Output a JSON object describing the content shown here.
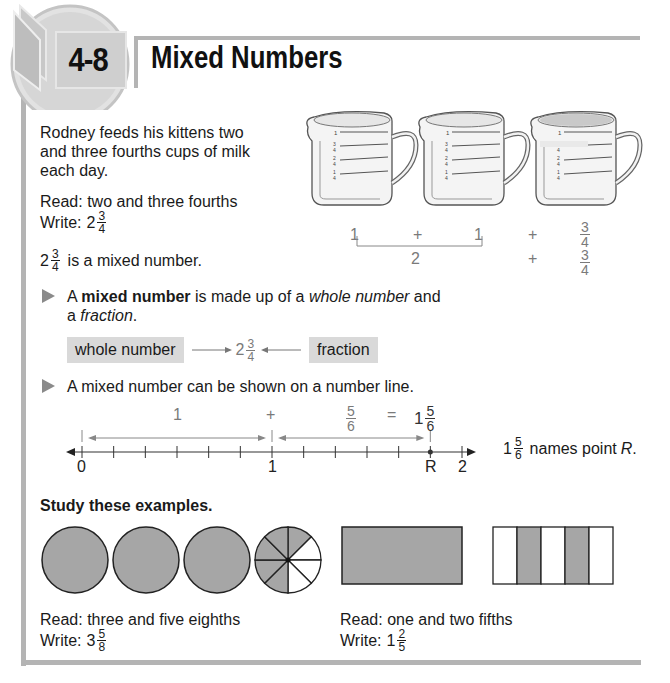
{
  "header": {
    "lesson_number": "4-8",
    "lesson_title": "Mixed Numbers"
  },
  "intro": {
    "story": [
      "Rodney feeds his kittens two",
      "and three fourths cups of milk",
      "each day."
    ],
    "read_label": "Read: two and three fourths",
    "write_label": "Write:",
    "write_whole": "2",
    "write_num": "3",
    "write_den": "4",
    "statement_whole": "2",
    "statement_num": "3",
    "statement_den": "4",
    "statement_text": "is a mixed number."
  },
  "cups": {
    "markings": [
      "1",
      "3/4",
      "2/4",
      "1/4"
    ],
    "fills": [
      1,
      1,
      0.75
    ],
    "row1": [
      "1",
      "+",
      "1",
      "+"
    ],
    "row1_frac": {
      "num": "3",
      "den": "4"
    },
    "row2": [
      "2",
      "+"
    ],
    "row2_frac": {
      "num": "3",
      "den": "4"
    }
  },
  "definition": {
    "prefix": "A ",
    "term": "mixed number",
    "middle": " is made up of a ",
    "whole_word": "whole number",
    "and": " and",
    "line2_prefix": "a ",
    "fraction_word": "fraction",
    "line2_suffix": "."
  },
  "diagram": {
    "whole_tag": "whole number",
    "fraction_tag": "fraction",
    "whole": "2",
    "num": "3",
    "den": "4"
  },
  "numberline_intro": "A mixed number can be shown on a number line.",
  "numberline": {
    "labels": [
      "0",
      "1",
      "R",
      "2"
    ],
    "segment1_label": "1",
    "plus": "+",
    "segment2": {
      "num": "5",
      "den": "6"
    },
    "equals": "=",
    "result": {
      "whole": "1",
      "num": "5",
      "den": "6"
    },
    "range": [
      0,
      2
    ],
    "ticks_per_unit": 6,
    "point_R_value": 1.8333,
    "caption_whole": "1",
    "caption_num": "5",
    "caption_den": "6",
    "caption_text": "names point",
    "caption_point": "R",
    "caption_end": "."
  },
  "examples": {
    "heading": "Study these examples.",
    "example1": {
      "whole_circles": 3,
      "slices": 8,
      "shaded_slices": 5,
      "read": "Read: three and five eighths",
      "write_label": "Write:",
      "whole": "3",
      "num": "5",
      "den": "8"
    },
    "example2": {
      "whole_rects": 1,
      "parts": 5,
      "shaded_parts": [
        2,
        4
      ],
      "read": "Read: one and two fifths",
      "write_label": "Write:",
      "whole": "1",
      "num": "2",
      "den": "5"
    }
  },
  "colors": {
    "shade": "#a6a6a6",
    "frame": "#b4b4b4",
    "tag_bg": "#d9d9d9",
    "bullet": "#8a8a8a",
    "text": "#1a1a1a",
    "muted": "#7a7a7a"
  }
}
